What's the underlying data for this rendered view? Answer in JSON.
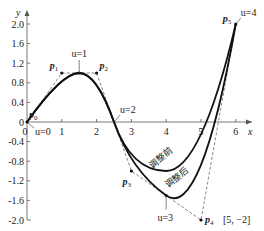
{
  "chart_data": {
    "type": "line",
    "title": "",
    "xlabel": "x",
    "ylabel": "y",
    "xlim": [
      0,
      6.4
    ],
    "ylim": [
      -2.0,
      2.1
    ],
    "x_ticks": [
      0,
      1,
      2,
      3,
      4,
      5,
      6
    ],
    "y_ticks": [
      2.0,
      1.6,
      1.2,
      0.8,
      0.4,
      0,
      -0.4,
      -0.8,
      -1.2,
      -1.6,
      -2.0
    ],
    "y_tick_labels": [
      "2.0",
      "1.6",
      "1.2",
      "0.8",
      "0.4",
      "0",
      "-0.4",
      "-0.8",
      "-1.2",
      "-1.6",
      "-2.0"
    ],
    "x_tick_labels": [
      "0",
      "1",
      "2",
      "3",
      "4",
      "5",
      "6"
    ],
    "control_points": [
      {
        "name": "p0",
        "label": "P",
        "sub": "0",
        "x": 0,
        "y": 0
      },
      {
        "name": "p1",
        "label": "P",
        "sub": "1",
        "x": 1,
        "y": 1.0
      },
      {
        "name": "p2",
        "label": "P",
        "sub": "2",
        "x": 2,
        "y": 1.0
      },
      {
        "name": "p3",
        "label": "P",
        "sub": "3",
        "x": 3,
        "y": -1.0
      },
      {
        "name": "p4",
        "label": "P",
        "sub": "4",
        "x": 5,
        "y": -2.0,
        "note": "[5, −2]"
      },
      {
        "name": "p5",
        "label": "P",
        "sub": "5",
        "x": 6,
        "y": 2.0
      }
    ],
    "series": [
      {
        "name": "调整前",
        "control_points": [
          [
            0,
            0
          ],
          [
            1,
            1
          ],
          [
            2,
            1
          ],
          [
            3,
            -1
          ],
          [
            5,
            -1
          ],
          [
            6,
            2
          ]
        ]
      },
      {
        "name": "调整后",
        "control_points": [
          [
            0,
            0
          ],
          [
            1,
            1
          ],
          [
            2,
            1
          ],
          [
            3,
            -1
          ],
          [
            5,
            -2
          ],
          [
            6,
            2
          ]
        ]
      }
    ],
    "knot_labels": [
      {
        "text": "u=0",
        "x": 0,
        "y": 0
      },
      {
        "text": "u=1",
        "x": 1.5,
        "y": 1.0
      },
      {
        "text": "u=2",
        "x": 2.5,
        "y": 0
      },
      {
        "text": "u=3",
        "x": 4,
        "y": -1.5
      },
      {
        "text": "u=4",
        "x": 6,
        "y": 2.0
      }
    ],
    "annotations": [
      "调整前",
      "调整后"
    ]
  }
}
